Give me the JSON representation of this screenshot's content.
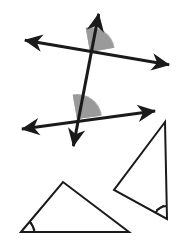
{
  "figure": {
    "background_color": "#ffffff",
    "stroke_color": "#1a1a1a",
    "shade_color": "#9a9a9a",
    "width": 183,
    "height": 247
  },
  "chart_data": {
    "type": "diagram",
    "xlabel": "",
    "ylabel": "",
    "grid": false,
    "legend": "none",
    "coordinate_space": {
      "x_range": [
        0,
        183
      ],
      "y_range": [
        0,
        247
      ],
      "origin": "top-left",
      "units": "pixels"
    },
    "elements": [
      {
        "name": "upper-line",
        "kind": "double-arrow-line",
        "from": [
          18,
          39
        ],
        "to": [
          176,
          66
        ],
        "arrowheads": [
          "start",
          "end"
        ],
        "stroke_width": 3
      },
      {
        "name": "lower-line",
        "kind": "double-arrow-line",
        "from": [
          15,
          130
        ],
        "to": [
          162,
          110
        ],
        "arrowheads": [
          "start",
          "end"
        ],
        "stroke_width": 3
      },
      {
        "name": "transversal-line",
        "kind": "double-arrow-line",
        "from": [
          100,
          7
        ],
        "to": [
          72,
          153
        ],
        "arrowheads": [
          "start",
          "end"
        ],
        "stroke_width": 3
      },
      {
        "name": "upper-shaded-angle",
        "kind": "shaded-angle-wedge",
        "vertex": [
          90,
          52
        ],
        "radius": 24,
        "start_angle_deg": 10,
        "end_angle_deg": 100,
        "fill": "#9a9a9a"
      },
      {
        "name": "lower-shaded-angle",
        "kind": "shaded-angle-wedge",
        "vertex": [
          77,
          119
        ],
        "radius": 24,
        "start_angle_deg": 8,
        "end_angle_deg": 100,
        "fill": "#9a9a9a"
      },
      {
        "name": "left-triangle",
        "kind": "triangle",
        "vertices": [
          [
            21,
            232
          ],
          [
            63,
            182
          ],
          [
            129,
            232
          ]
        ],
        "stroke_width": 2,
        "fill": "none",
        "marked_vertex_index": 0
      },
      {
        "name": "right-triangle",
        "kind": "triangle",
        "vertices": [
          [
            165,
            122
          ],
          [
            114,
            190
          ],
          [
            167,
            219
          ]
        ],
        "stroke_width": 2,
        "fill": "none",
        "marked_vertex_index": 2
      },
      {
        "name": "left-triangle-angle-mark",
        "kind": "angle-arc-with-tick",
        "vertex": [
          21,
          232
        ],
        "radius": 13,
        "ticks": 1
      },
      {
        "name": "right-triangle-angle-mark",
        "kind": "angle-arc-with-tick",
        "vertex": [
          167,
          219
        ],
        "radius": 13,
        "ticks": 1
      }
    ],
    "annotations": [],
    "tick_labels": [],
    "values": [],
    "categories": []
  },
  "labels": {
    "ghost_artifact": ""
  },
  "icons": {
    "arrowhead": "arrowhead-icon",
    "angle_arc": "angle-arc-icon",
    "shaded_wedge": "shaded-angle-icon"
  }
}
